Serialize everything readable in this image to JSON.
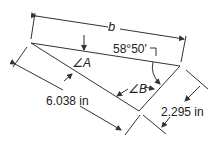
{
  "diagram": {
    "labels": {
      "side_b": "b",
      "angle_value": "58°50'",
      "angle_A": "∠A",
      "angle_B": "∠B",
      "side_long": "6.038 in",
      "side_short": "2.295 in"
    },
    "colors": {
      "line": "#333333",
      "background": "#ffffff"
    }
  }
}
